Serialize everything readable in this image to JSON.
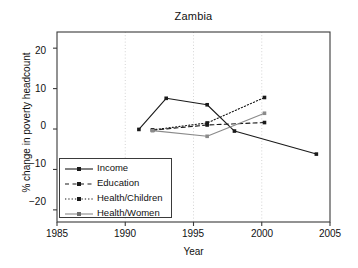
{
  "chart_data": {
    "type": "line",
    "title": "Zambia",
    "xlabel": "Year",
    "ylabel": "% change in poverty headcount",
    "xlim": [
      1985,
      2005
    ],
    "ylim": [
      -23,
      24
    ],
    "xticks": [
      "1985",
      "1990",
      "1995",
      "2000",
      "2005"
    ],
    "xtick_values": [
      1985,
      1990,
      1995,
      2000,
      2005
    ],
    "yticks": [
      "20",
      "10",
      "0",
      "−10",
      "−20"
    ],
    "ytick_values": [
      20,
      10,
      0,
      -10,
      -20
    ],
    "grid": "vertical-dotted-at-xticks",
    "legend_position": "lower-left-inside",
    "series": [
      {
        "name": "Income",
        "style": "solid",
        "color": "#1a1a1a",
        "x": [
          1991,
          1993,
          1996,
          1998,
          2004
        ],
        "values": [
          -0.1,
          7.6,
          6.0,
          -0.5,
          -6.2
        ]
      },
      {
        "name": "Education",
        "style": "dashed",
        "color": "#1a1a1a",
        "x": [
          1992,
          1996,
          2000.2
        ],
        "values": [
          -0.3,
          1.0,
          1.6
        ]
      },
      {
        "name": "Health/Children",
        "style": "dotted",
        "color": "#1a1a1a",
        "x": [
          1992,
          1996,
          2000.2
        ],
        "values": [
          -0.2,
          1.5,
          7.8
        ]
      },
      {
        "name": "Health/Women",
        "style": "solid",
        "color": "#8a8a8a",
        "x": [
          1992,
          1996,
          2000.2
        ],
        "values": [
          -0.4,
          -1.8,
          3.9
        ]
      }
    ]
  },
  "legend": {
    "items": [
      {
        "label": "Income"
      },
      {
        "label": "Education"
      },
      {
        "label": "Health/Children"
      },
      {
        "label": "Health/Women"
      }
    ]
  }
}
